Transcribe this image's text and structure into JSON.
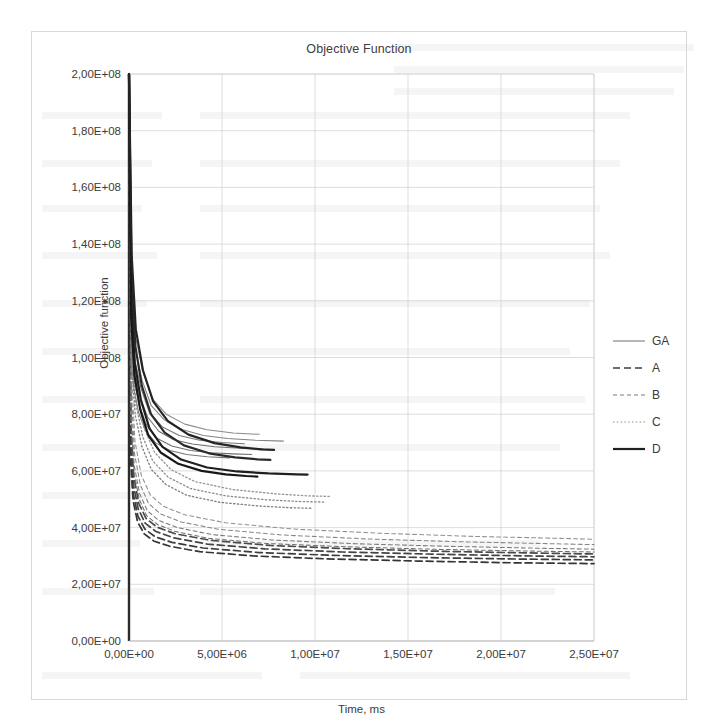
{
  "figure": {
    "title": "Objective Function",
    "background": "#ffffff",
    "frame_color": "#d8d8d8"
  },
  "legend": {
    "position": "right",
    "items": [
      {
        "label": "GA",
        "style": "solid-thin",
        "color": "#6e6e6e",
        "width": 1.0
      },
      {
        "label": "A",
        "style": "dashed",
        "color": "#3d3d3d",
        "width": 1.6
      },
      {
        "label": "B",
        "style": "dashed-fine",
        "color": "#7a7a7a",
        "width": 1.1
      },
      {
        "label": "C",
        "style": "dotted",
        "color": "#8a8a8a",
        "width": 1.1
      },
      {
        "label": "D",
        "style": "solid-thick",
        "color": "#1f1f1f",
        "width": 2.2
      }
    ]
  },
  "chart_data": {
    "type": "line",
    "title": "Objective Function",
    "xlabel": "Time, ms",
    "ylabel": "Objective function",
    "xlim": [
      0,
      25000000
    ],
    "ylim": [
      0,
      200000000
    ],
    "grid": true,
    "legend_position": "right",
    "xticks": [
      0,
      5000000,
      10000000,
      15000000,
      20000000,
      25000000
    ],
    "xticklabels": [
      "0,00E+00",
      "5,00E+06",
      "1,00E+07",
      "1,50E+07",
      "2,00E+07",
      "2,50E+07"
    ],
    "yticks": [
      0,
      20000000,
      40000000,
      60000000,
      80000000,
      100000000,
      120000000,
      140000000,
      160000000,
      180000000,
      200000000
    ],
    "yticklabels": [
      "0,00E+00",
      "2,00E+07",
      "4,00E+07",
      "6,00E+07",
      "8,00E+07",
      "1,00E+08",
      "1,20E+08",
      "1,40E+08",
      "1,60E+08",
      "1,80E+08",
      "2,00E+08"
    ],
    "note": "Convergence curves: all runs start at 2,00E+08 and decay sharply. GA/D groups plateau near 6-7E+07 and terminate early (5-10E+06 ms). C (dotted) plateaus near 4,9E+07. A/B (dashed) plateau between 2,7E+07 and 3,9E+07 and run to 2,5E+07 ms.",
    "series": [
      {
        "name": "GA",
        "style": "solid-thin",
        "color": "#6e6e6e",
        "x": [
          0,
          120000,
          300000,
          600000,
          1000000,
          1600000,
          2400000,
          3400000,
          4600000,
          6000000,
          7200000
        ],
        "y": [
          200000000,
          112000000,
          95000000,
          86000000,
          79000000,
          74000000,
          71000000,
          69500000,
          68500000,
          68000000,
          67800000
        ]
      },
      {
        "name": "GA",
        "style": "solid-thin",
        "color": "#787878",
        "x": [
          0,
          130000,
          320000,
          650000,
          1100000,
          1800000,
          2700000,
          3800000,
          5000000,
          6200000
        ],
        "y": [
          200000000,
          118000000,
          99000000,
          89000000,
          80500000,
          75500000,
          72500000,
          70800000,
          70000000,
          69600000
        ]
      },
      {
        "name": "GA",
        "style": "solid-thin",
        "color": "#707070",
        "x": [
          0,
          110000,
          280000,
          560000,
          950000,
          1500000,
          2300000,
          3300000,
          4400000,
          5600000,
          6600000
        ],
        "y": [
          200000000,
          106000000,
          92000000,
          83000000,
          76000000,
          71500000,
          68800000,
          67200000,
          66400000,
          66000000,
          65800000
        ]
      },
      {
        "name": "GA",
        "style": "solid-thin",
        "color": "#828282",
        "x": [
          0,
          140000,
          340000,
          700000,
          1200000,
          1900000,
          2900000,
          4000000,
          5300000,
          6800000,
          8300000
        ],
        "y": [
          200000000,
          124000000,
          103000000,
          92000000,
          83000000,
          78000000,
          74500000,
          72500000,
          71400000,
          70800000,
          70500000
        ]
      },
      {
        "name": "GA",
        "style": "solid-thin",
        "color": "#767676",
        "x": [
          0,
          100000,
          260000,
          520000,
          900000,
          1450000,
          2200000,
          3100000,
          4200000,
          5400000
        ],
        "y": [
          200000000,
          101000000,
          89000000,
          80500000,
          74000000,
          69800000,
          67200000,
          65800000,
          65000000,
          64600000
        ]
      },
      {
        "name": "GA",
        "style": "solid-thin",
        "color": "#8a8a8a",
        "x": [
          0,
          150000,
          360000,
          740000,
          1250000,
          2000000,
          3000000,
          4200000,
          5600000,
          7000000
        ],
        "y": [
          200000000,
          130000000,
          107000000,
          95000000,
          85500000,
          80000000,
          76500000,
          74500000,
          73400000,
          72900000
        ]
      },
      {
        "name": "A",
        "style": "dashed",
        "color": "#3d3d3d",
        "x": [
          0,
          90000,
          230000,
          480000,
          850000,
          1400000,
          2300000,
          4000000,
          7000000,
          11000000,
          16000000,
          21000000,
          25000000
        ],
        "y": [
          200000000,
          68000000,
          52000000,
          44000000,
          39500000,
          36800000,
          34800000,
          32800000,
          31200000,
          30200000,
          29400000,
          28900000,
          28600000
        ]
      },
      {
        "name": "A",
        "style": "dashed",
        "color": "#444444",
        "x": [
          0,
          95000,
          240000,
          500000,
          880000,
          1450000,
          2400000,
          4200000,
          7300000,
          11500000,
          16500000,
          21500000,
          25000000
        ],
        "y": [
          200000000,
          72000000,
          55000000,
          46500000,
          41500000,
          38600000,
          36400000,
          34200000,
          32500000,
          31400000,
          30600000,
          30000000,
          29700000
        ]
      },
      {
        "name": "A",
        "style": "dashed",
        "color": "#353535",
        "x": [
          0,
          85000,
          220000,
          460000,
          820000,
          1350000,
          2200000,
          3800000,
          6700000,
          10500000,
          15500000,
          20500000,
          25000000
        ],
        "y": [
          200000000,
          64000000,
          49500000,
          42000000,
          37800000,
          35200000,
          33400000,
          31500000,
          30000000,
          29000000,
          28200000,
          27600000,
          27300000
        ]
      },
      {
        "name": "A",
        "style": "dashed",
        "color": "#4a4a4a",
        "x": [
          0,
          100000,
          255000,
          530000,
          920000,
          1520000,
          2500000,
          4400000,
          7600000,
          12000000,
          17000000,
          22000000,
          25000000
        ],
        "y": [
          200000000,
          76000000,
          58000000,
          48500000,
          43200000,
          40100000,
          37800000,
          35500000,
          33700000,
          32500000,
          31600000,
          31000000,
          30700000
        ]
      },
      {
        "name": "B",
        "style": "dashed-fine",
        "color": "#7a7a7a",
        "x": [
          0,
          110000,
          280000,
          570000,
          980000,
          1600000,
          2600000,
          4500000,
          7800000,
          12200000,
          17200000,
          22200000,
          25000000
        ],
        "y": [
          200000000,
          82000000,
          62000000,
          52000000,
          46000000,
          42500000,
          40000000,
          37500000,
          35600000,
          34300000,
          33400000,
          32700000,
          32400000
        ]
      },
      {
        "name": "B",
        "style": "dashed-fine",
        "color": "#858585",
        "x": [
          0,
          120000,
          300000,
          610000,
          1050000,
          1700000,
          2800000,
          4800000,
          8200000,
          12800000,
          17800000,
          22800000,
          25000000
        ],
        "y": [
          200000000,
          88000000,
          66000000,
          55000000,
          48500000,
          44800000,
          42000000,
          39400000,
          37400000,
          36000000,
          35000000,
          34300000,
          34000000
        ]
      },
      {
        "name": "B",
        "style": "dashed-fine",
        "color": "#6f6f6f",
        "x": [
          0,
          105000,
          270000,
          550000,
          950000,
          1550000,
          2500000,
          4300000,
          7400000,
          11800000,
          16800000,
          21800000,
          25000000
        ],
        "y": [
          200000000,
          79000000,
          59500000,
          50000000,
          44200000,
          41000000,
          38600000,
          36200000,
          34400000,
          33200000,
          32300000,
          31700000,
          31400000
        ]
      },
      {
        "name": "B",
        "style": "dashed-fine",
        "color": "#909090",
        "x": [
          0,
          130000,
          320000,
          660000,
          1150000,
          1850000,
          3000000,
          5200000,
          8800000,
          13500000,
          18500000,
          23200000,
          25000000
        ],
        "y": [
          200000000,
          94000000,
          70500000,
          58500000,
          51500000,
          47500000,
          44500000,
          41700000,
          39500000,
          38000000,
          36900000,
          36200000,
          35900000
        ]
      },
      {
        "name": "C",
        "style": "dotted",
        "color": "#8a8a8a",
        "x": [
          0,
          140000,
          360000,
          740000,
          1280000,
          2100000,
          3300000,
          5200000,
          7400000,
          9200000,
          10500000
        ],
        "y": [
          200000000,
          104000000,
          84000000,
          72000000,
          63500000,
          57800000,
          53800000,
          51200000,
          49800000,
          49200000,
          49000000
        ]
      },
      {
        "name": "C",
        "style": "dotted",
        "color": "#959595",
        "x": [
          0,
          150000,
          380000,
          790000,
          1380000,
          2250000,
          3550000,
          5600000,
          7900000,
          9600000,
          10800000
        ],
        "y": [
          200000000,
          110000000,
          88500000,
          75500000,
          66500000,
          60500000,
          56200000,
          53400000,
          51900000,
          51200000,
          51000000
        ]
      },
      {
        "name": "C",
        "style": "dotted",
        "color": "#7e7e7e",
        "x": [
          0,
          132000,
          340000,
          700000,
          1200000,
          1980000,
          3100000,
          4900000,
          7000000,
          8700000,
          9900000
        ],
        "y": [
          200000000,
          98000000,
          79500000,
          68500000,
          60500000,
          55200000,
          51400000,
          48900000,
          47600000,
          47000000,
          46800000
        ]
      },
      {
        "name": "D",
        "style": "solid-thick",
        "color": "#1f1f1f",
        "x": [
          0,
          125000,
          310000,
          640000,
          1100000,
          1800000,
          2800000,
          4200000,
          5800000,
          7500000,
          9000000,
          9600000
        ],
        "y": [
          200000000,
          120000000,
          98000000,
          85000000,
          75000000,
          68500000,
          64000000,
          61200000,
          59800000,
          59100000,
          58800000,
          58700000
        ]
      },
      {
        "name": "D",
        "style": "solid-thick",
        "color": "#2a2a2a",
        "x": [
          0,
          135000,
          340000,
          690000,
          1180000,
          1920000,
          2950000,
          4300000,
          5700000,
          6900000,
          7600000
        ],
        "y": [
          200000000,
          128000000,
          104000000,
          90000000,
          80000000,
          73500000,
          69000000,
          66200000,
          64800000,
          64100000,
          63900000
        ]
      },
      {
        "name": "D",
        "style": "solid-thick",
        "color": "#181818",
        "x": [
          0,
          118000,
          295000,
          610000,
          1040000,
          1700000,
          2650000,
          3900000,
          5200000,
          6300000,
          6900000
        ],
        "y": [
          200000000,
          114000000,
          93500000,
          81500000,
          72500000,
          66500000,
          62500000,
          60000000,
          58800000,
          58200000,
          58000000
        ]
      },
      {
        "name": "D",
        "style": "solid-thick",
        "color": "#242424",
        "x": [
          0,
          145000,
          365000,
          750000,
          1300000,
          2100000,
          3200000,
          4600000,
          6000000,
          7100000,
          7800000
        ],
        "y": [
          200000000,
          136000000,
          110000000,
          95500000,
          84500000,
          77500000,
          72800000,
          69800000,
          68300000,
          67600000,
          67400000
        ]
      }
    ]
  },
  "axes": {
    "x_title": "Time, ms",
    "y_title": "Objective function"
  }
}
